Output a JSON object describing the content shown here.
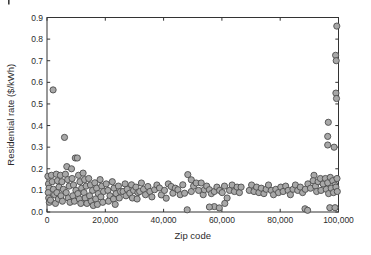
{
  "figure": {
    "cropped_corner_mark": "|"
  },
  "chart_data": {
    "type": "scatter",
    "title": "",
    "xlabel": "Zip code",
    "ylabel": "Residential rate ($/kWh)",
    "xlim": [
      0,
      100000
    ],
    "ylim": [
      0,
      0.9
    ],
    "grid": false,
    "legend": "none",
    "box": true,
    "xticks": [
      0,
      20000,
      40000,
      60000,
      80000,
      100000
    ],
    "xtick_labels": [
      "0",
      "20,000",
      "40,000",
      "60,000",
      "80,000",
      "100,000"
    ],
    "yticks": [
      0,
      0.1,
      0.2,
      0.3,
      0.4,
      0.5,
      0.6,
      0.7,
      0.8,
      0.9
    ],
    "ytick_labels": [
      "0.0",
      "0.1",
      "0.2",
      "0.3",
      "0.4",
      "0.5",
      "0.6",
      "0.7",
      "0.8",
      "0.9"
    ],
    "marker": {
      "shape": "circle",
      "fill": "#a8a8a8",
      "stroke": "#4d4d4d",
      "radius_px": 3.1,
      "stroke_width": 0.9
    },
    "axis_color": "#333333",
    "points": [
      [
        2100,
        0.565
      ],
      [
        6000,
        0.345
      ],
      [
        9700,
        0.25
      ],
      [
        10400,
        0.25
      ],
      [
        6800,
        0.21
      ],
      [
        8400,
        0.2
      ],
      [
        300,
        0.165
      ],
      [
        500,
        0.13
      ],
      [
        700,
        0.11
      ],
      [
        400,
        0.09
      ],
      [
        600,
        0.065
      ],
      [
        800,
        0.045
      ],
      [
        1500,
        0.17
      ],
      [
        1800,
        0.14
      ],
      [
        2200,
        0.105
      ],
      [
        2600,
        0.08
      ],
      [
        1200,
        0.055
      ],
      [
        2900,
        0.04
      ],
      [
        3200,
        0.175
      ],
      [
        3600,
        0.145
      ],
      [
        4100,
        0.115
      ],
      [
        3400,
        0.09
      ],
      [
        3900,
        0.06
      ],
      [
        4600,
        0.17
      ],
      [
        5100,
        0.14
      ],
      [
        5600,
        0.105
      ],
      [
        4800,
        0.075
      ],
      [
        5300,
        0.05
      ],
      [
        6300,
        0.175
      ],
      [
        7100,
        0.15
      ],
      [
        7600,
        0.12
      ],
      [
        6600,
        0.09
      ],
      [
        7300,
        0.065
      ],
      [
        7900,
        0.045
      ],
      [
        8600,
        0.155
      ],
      [
        9100,
        0.125
      ],
      [
        9900,
        0.1
      ],
      [
        8900,
        0.075
      ],
      [
        9400,
        0.05
      ],
      [
        10800,
        0.17
      ],
      [
        11300,
        0.14
      ],
      [
        11900,
        0.11
      ],
      [
        10600,
        0.085
      ],
      [
        11100,
        0.06
      ],
      [
        11600,
        0.04
      ],
      [
        12400,
        0.18
      ],
      [
        12900,
        0.15
      ],
      [
        13400,
        0.12
      ],
      [
        12700,
        0.09
      ],
      [
        13100,
        0.065
      ],
      [
        13700,
        0.04
      ],
      [
        14300,
        0.155
      ],
      [
        14900,
        0.125
      ],
      [
        15600,
        0.1
      ],
      [
        14600,
        0.075
      ],
      [
        15200,
        0.05
      ],
      [
        15900,
        0.03
      ],
      [
        16400,
        0.135
      ],
      [
        17000,
        0.11
      ],
      [
        17600,
        0.085
      ],
      [
        16700,
        0.06
      ],
      [
        17300,
        0.035
      ],
      [
        18200,
        0.15
      ],
      [
        18800,
        0.12
      ],
      [
        19400,
        0.095
      ],
      [
        18500,
        0.07
      ],
      [
        19100,
        0.045
      ],
      [
        20300,
        0.13
      ],
      [
        20900,
        0.1
      ],
      [
        21600,
        0.075
      ],
      [
        21100,
        0.05
      ],
      [
        22400,
        0.14
      ],
      [
        23000,
        0.11
      ],
      [
        23700,
        0.085
      ],
      [
        22800,
        0.06
      ],
      [
        23400,
        0.035
      ],
      [
        24500,
        0.12
      ],
      [
        25200,
        0.095
      ],
      [
        24800,
        0.065
      ],
      [
        26100,
        0.095
      ],
      [
        26800,
        0.13
      ],
      [
        27500,
        0.105
      ],
      [
        27100,
        0.075
      ],
      [
        28400,
        0.087
      ],
      [
        29000,
        0.126
      ],
      [
        29700,
        0.1
      ],
      [
        29300,
        0.065
      ],
      [
        30500,
        0.115
      ],
      [
        31200,
        0.09
      ],
      [
        31800,
        0.095
      ],
      [
        30900,
        0.06
      ],
      [
        32400,
        0.134
      ],
      [
        33100,
        0.105
      ],
      [
        33800,
        0.08
      ],
      [
        34600,
        0.118
      ],
      [
        35300,
        0.095
      ],
      [
        36000,
        0.07
      ],
      [
        36900,
        0.103
      ],
      [
        37700,
        0.125
      ],
      [
        38600,
        0.111
      ],
      [
        39200,
        0.079
      ],
      [
        40900,
        0.064
      ],
      [
        40300,
        0.1
      ],
      [
        41600,
        0.13
      ],
      [
        42600,
        0.118
      ],
      [
        43200,
        0.087
      ],
      [
        44000,
        0.11
      ],
      [
        44900,
        0.103
      ],
      [
        45700,
        0.08
      ],
      [
        46600,
        0.126
      ],
      [
        47200,
        0.087
      ],
      [
        48300,
        0.173
      ],
      [
        48100,
        0.01
      ],
      [
        49500,
        0.149
      ],
      [
        49500,
        0.095
      ],
      [
        50300,
        0.12
      ],
      [
        51200,
        0.134
      ],
      [
        52000,
        0.1
      ],
      [
        52900,
        0.134
      ],
      [
        53600,
        0.08
      ],
      [
        54000,
        0.103
      ],
      [
        54800,
        0.12
      ],
      [
        55700,
        0.103
      ],
      [
        56400,
        0.085
      ],
      [
        57400,
        0.095
      ],
      [
        57400,
        0.025
      ],
      [
        55700,
        0.023
      ],
      [
        58300,
        0.115
      ],
      [
        59100,
        0.019
      ],
      [
        59200,
        0.1
      ],
      [
        60100,
        0.09
      ],
      [
        60900,
        0.12
      ],
      [
        61800,
        0.065
      ],
      [
        61000,
        0.04
      ],
      [
        62600,
        0.1
      ],
      [
        63500,
        0.125
      ],
      [
        64300,
        0.095
      ],
      [
        65200,
        0.115
      ],
      [
        66000,
        0.09
      ],
      [
        66600,
        0.115
      ],
      [
        69400,
        0.1
      ],
      [
        70200,
        0.125
      ],
      [
        71000,
        0.095
      ],
      [
        71900,
        0.115
      ],
      [
        72700,
        0.09
      ],
      [
        73500,
        0.11
      ],
      [
        74400,
        0.085
      ],
      [
        75200,
        0.105
      ],
      [
        76000,
        0.125
      ],
      [
        76900,
        0.1
      ],
      [
        77700,
        0.08
      ],
      [
        78500,
        0.105
      ],
      [
        79400,
        0.09
      ],
      [
        80200,
        0.115
      ],
      [
        81000,
        0.095
      ],
      [
        81900,
        0.12
      ],
      [
        82700,
        0.1
      ],
      [
        83500,
        0.08
      ],
      [
        84400,
        0.105
      ],
      [
        85200,
        0.125
      ],
      [
        86000,
        0.1
      ],
      [
        86900,
        0.115
      ],
      [
        87700,
        0.09
      ],
      [
        88500,
        0.015
      ],
      [
        89400,
        0.008
      ],
      [
        88600,
        0.105
      ],
      [
        89500,
        0.13
      ],
      [
        90400,
        0.11
      ],
      [
        91600,
        0.17
      ],
      [
        91300,
        0.145
      ],
      [
        92100,
        0.12
      ],
      [
        93000,
        0.14
      ],
      [
        93800,
        0.155
      ],
      [
        94700,
        0.13
      ],
      [
        92500,
        0.095
      ],
      [
        94000,
        0.1
      ],
      [
        95500,
        0.155
      ],
      [
        96300,
        0.135
      ],
      [
        97200,
        0.16
      ],
      [
        98000,
        0.145
      ],
      [
        98800,
        0.125
      ],
      [
        99500,
        0.155
      ],
      [
        95800,
        0.105
      ],
      [
        96600,
        0.085
      ],
      [
        97500,
        0.11
      ],
      [
        98300,
        0.09
      ],
      [
        99100,
        0.115
      ],
      [
        99600,
        0.095
      ],
      [
        97000,
        0.02
      ],
      [
        98800,
        0.02
      ],
      [
        96500,
        0.415
      ],
      [
        96300,
        0.35
      ],
      [
        96300,
        0.31
      ],
      [
        98500,
        0.3
      ],
      [
        99400,
        0.86
      ],
      [
        99000,
        0.725
      ],
      [
        99200,
        0.7
      ],
      [
        99100,
        0.55
      ],
      [
        99300,
        0.525
      ]
    ]
  },
  "layout_px": {
    "plot_left": 47,
    "plot_right": 338.5,
    "plot_top": 17.5,
    "plot_bottom": 212,
    "tick_len": 3.2
  }
}
